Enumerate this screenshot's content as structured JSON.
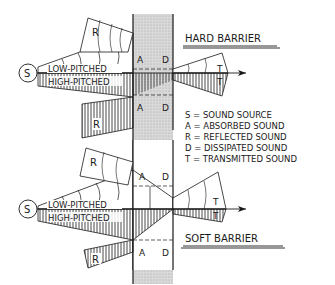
{
  "diagram": {
    "colors": {
      "ink": "#1a1a1a",
      "barrier_fill": "#d6d6d6",
      "background": "#ffffff"
    },
    "hard": {
      "title": "HARD BARRIER",
      "source_label": "S",
      "low_label": "LOW-PITCHED",
      "high_label": "HIGH-PITCHED",
      "reflected_top": "R",
      "reflected_bottom": "R",
      "absorbed_top": "A",
      "dissipated_top": "D",
      "absorbed_bottom": "A",
      "dissipated_bottom": "D",
      "transmitted_top": "T",
      "transmitted_bottom": "T"
    },
    "soft": {
      "title": "SOFT BARRIER",
      "source_label": "S",
      "low_label": "LOW-PITCHED",
      "high_label": "HIGH-PITCHED",
      "reflected_top": "R",
      "reflected_bottom": "R",
      "absorbed_top": "A",
      "dissipated_top": "D",
      "absorbed_bottom": "A",
      "dissipated_bottom": "D",
      "transmitted_top": "T",
      "transmitted_bottom": "T"
    },
    "legend": [
      "S = SOUND SOURCE",
      "A = ABSORBED SOUND",
      "R = REFLECTED SOUND",
      "D = DISSIPATED SOUND",
      "T = TRANSMITTED SOUND"
    ]
  }
}
